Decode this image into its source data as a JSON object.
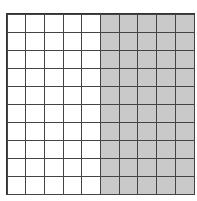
{
  "diagram": {
    "type": "hundred-grid",
    "rows": 10,
    "columns": 10,
    "total_squares": 100,
    "shaded_columns": [
      5,
      6,
      7,
      8,
      9
    ],
    "shaded_count": 50,
    "unshaded_count": 50,
    "colors": {
      "shaded": "#c9c9c9",
      "unshaded": "#ffffff",
      "lines": "#444444"
    }
  }
}
